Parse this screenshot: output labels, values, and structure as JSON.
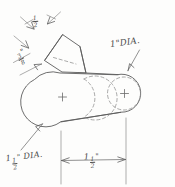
{
  "drawing": {
    "title": "Hand-drawn mechanical part sketch",
    "description": "Pencil sketch of an obround (slot-shaped) body with an angled rectangular arm, showing hidden circles and four dimension callouts.",
    "ink_color": "#5c5c5c",
    "hidden_line_color": "#8d8d8d",
    "paper_color": "#fdfdfc"
  },
  "annotations": {
    "half_top": {
      "whole": "",
      "numerator": "1",
      "denominator": "2",
      "unit": "",
      "full_text": "1/2"
    },
    "three_eighths": {
      "whole": "",
      "numerator": "3",
      "denominator": "8",
      "unit": "\"",
      "full_text": "3/8\""
    },
    "one_inch_dia": {
      "text": "1\"DIA."
    },
    "one_half_dia": {
      "whole": "1",
      "numerator": "1",
      "denominator": "2",
      "unit": "\"",
      "suffix": "DIA.",
      "full_text": "1 1/2\" DIA."
    },
    "one_half_width": {
      "whole": "1",
      "numerator": "1",
      "denominator": "2",
      "unit": "\"",
      "full_text": "1 1/2\""
    }
  },
  "features": {
    "large_bore_center": "+",
    "small_bore_center": "+"
  }
}
